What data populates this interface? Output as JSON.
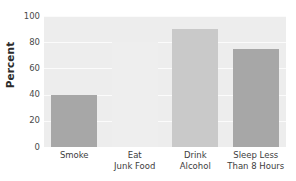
{
  "chart_data": {
    "type": "bar",
    "title": "",
    "xlabel": "",
    "ylabel": "Percent",
    "ylim": [
      0,
      100
    ],
    "yticks": [
      0,
      20,
      40,
      60,
      80,
      100
    ],
    "grid": true,
    "legend": "none",
    "categories": [
      "Smoke",
      "Eat Junk Food",
      "Drink Alcohol",
      "Sleep Less Than 8 Hours"
    ],
    "category_lines": [
      [
        "Smoke",
        ""
      ],
      [
        "Eat",
        "Junk Food"
      ],
      [
        "Drink",
        "Alcohol"
      ],
      [
        "Sleep Less",
        "Than 8 Hours"
      ]
    ],
    "values": [
      40,
      80,
      90,
      75
    ],
    "bar_colors": [
      "#a7a7a7",
      "#eeeeee",
      "#c9c9c9",
      "#a7a7a7"
    ]
  },
  "style": {
    "plot_background": "#ededed",
    "gridline_color": "#fbfbfb",
    "page_background": "#ffffff",
    "text_color": "#3b3b3b"
  },
  "axis": {
    "y_tick_labels": [
      "100",
      "80",
      "60",
      "40",
      "20",
      "0"
    ]
  }
}
